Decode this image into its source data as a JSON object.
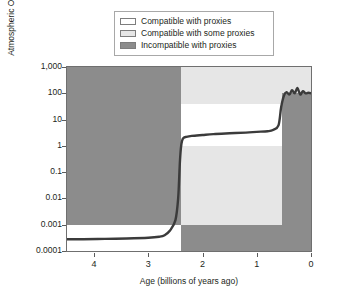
{
  "legend": {
    "items": [
      {
        "label": "Compatible with proxies",
        "color": "#ffffff",
        "swatch": "white-swatch"
      },
      {
        "label": "Compatible with some proxies",
        "color": "#e6e6e6",
        "swatch": "light-gray-swatch"
      },
      {
        "label": "Incompatible with proxies",
        "color": "#8c8c8c",
        "swatch": "dark-gray-swatch"
      }
    ]
  },
  "axes": {
    "ylabel_main": "Atmospheric O",
    "ylabel_sub": "2",
    "ylabel_tail": " (percentage of PAL)",
    "xlabel": "Age (billions of years ago)",
    "yticks": [
      "1,000",
      "100",
      "10",
      "1",
      "0.1",
      "0.01",
      "0.001",
      "0.0001"
    ],
    "xticks": [
      "4",
      "3",
      "2",
      "1",
      "0"
    ]
  },
  "chart_data": {
    "type": "line",
    "title": "",
    "xlabel": "Age (billions of years ago)",
    "ylabel": "Atmospheric O2 (percentage of PAL)",
    "yscale": "log",
    "ylim": [
      0.0001,
      1000
    ],
    "xlim": [
      4.5,
      0
    ],
    "x_reversed": true,
    "grid": false,
    "legend_position": "top-center",
    "series": [
      {
        "name": "Atmospheric oxygen history",
        "x": [
          4.5,
          4.2,
          3.8,
          3.4,
          3.0,
          2.8,
          2.7,
          2.6,
          2.5,
          2.45,
          2.42,
          2.4,
          2.38,
          2.35,
          2.3,
          2.2,
          2.0,
          1.8,
          1.5,
          1.2,
          1.0,
          0.8,
          0.7,
          0.6,
          0.55,
          0.5,
          0.45,
          0.4,
          0.35,
          0.3,
          0.25,
          0.2,
          0.15,
          0.1,
          0.05,
          0
        ],
        "y": [
          0.00028,
          0.00028,
          0.00029,
          0.0003,
          0.00032,
          0.00035,
          0.0004,
          0.0006,
          0.0015,
          0.01,
          0.2,
          0.8,
          1.5,
          2.0,
          2.2,
          2.4,
          2.6,
          2.8,
          3.0,
          3.2,
          3.4,
          3.6,
          4.0,
          6.0,
          30,
          80,
          110,
          90,
          130,
          100,
          160,
          90,
          120,
          100,
          105,
          100
        ]
      }
    ],
    "regions": [
      {
        "name": "Archean incompatible zone",
        "x_start": 4.5,
        "x_end": 2.4,
        "y_low": 0.001,
        "y_high": 1000,
        "fill": "#8c8c8c",
        "category": "Incompatible with proxies"
      },
      {
        "name": "Archean compatible zone",
        "x_start": 4.5,
        "x_end": 2.4,
        "y_low": 0.0001,
        "y_high": 0.001,
        "fill": "#ffffff",
        "category": "Compatible with proxies"
      },
      {
        "name": "Proterozoic upper incompatible zone",
        "x_start": 2.4,
        "x_end": 0.54,
        "y_low": 40,
        "y_high": 1000,
        "fill": "#e6e6e6",
        "category": "Compatible with some proxies"
      },
      {
        "name": "Proterozoic compatible band",
        "x_start": 2.4,
        "x_end": 0.54,
        "y_low": 1,
        "y_high": 40,
        "fill": "#ffffff",
        "category": "Compatible with proxies"
      },
      {
        "name": "Proterozoic lower some-proxy zone",
        "x_start": 2.4,
        "x_end": 0.54,
        "y_low": 0.001,
        "y_high": 1,
        "fill": "#e6e6e6",
        "category": "Compatible with some proxies"
      },
      {
        "name": "Post-2.4Ga deep incompatible zone",
        "x_start": 2.4,
        "x_end": 0,
        "y_low": 0.0001,
        "y_high": 0.001,
        "fill": "#8c8c8c",
        "category": "Incompatible with proxies"
      },
      {
        "name": "Phanerozoic incompatible zone",
        "x_start": 0.54,
        "x_end": 0,
        "y_low": 0.001,
        "y_high": 100,
        "fill": "#8c8c8c",
        "category": "Incompatible with proxies"
      },
      {
        "name": "Phanerozoic upper some-proxy zone",
        "x_start": 0.54,
        "x_end": 0,
        "y_low": 100,
        "y_high": 1000,
        "fill": "#e6e6e6",
        "category": "Compatible with some proxies"
      }
    ]
  },
  "colors": {
    "incompatible": "#8c8c8c",
    "some_proxies": "#e6e6e6",
    "compatible": "#ffffff",
    "curve": "#3b3b3b",
    "frame": "#6f6f6f"
  }
}
